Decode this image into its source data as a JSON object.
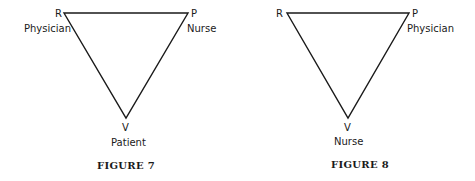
{
  "figures": [
    {
      "caption": "FIGURE 7",
      "vertices": {
        "top_left": {
          "letter": "R",
          "role": "Physician"
        },
        "top_right": {
          "letter": "P",
          "role": "Nurse"
        },
        "bottom": {
          "letter": "V",
          "role": "Patient"
        }
      }
    },
    {
      "caption": "FIGURE 8",
      "vertices": {
        "top_left": {
          "letter": "R",
          "role": ""
        },
        "top_right": {
          "letter": "P",
          "role": "Physician"
        },
        "bottom": {
          "letter": "V",
          "role": "Nurse"
        }
      }
    }
  ],
  "colors": {
    "ink": "#1a1a1a",
    "background": "#ffffff"
  }
}
